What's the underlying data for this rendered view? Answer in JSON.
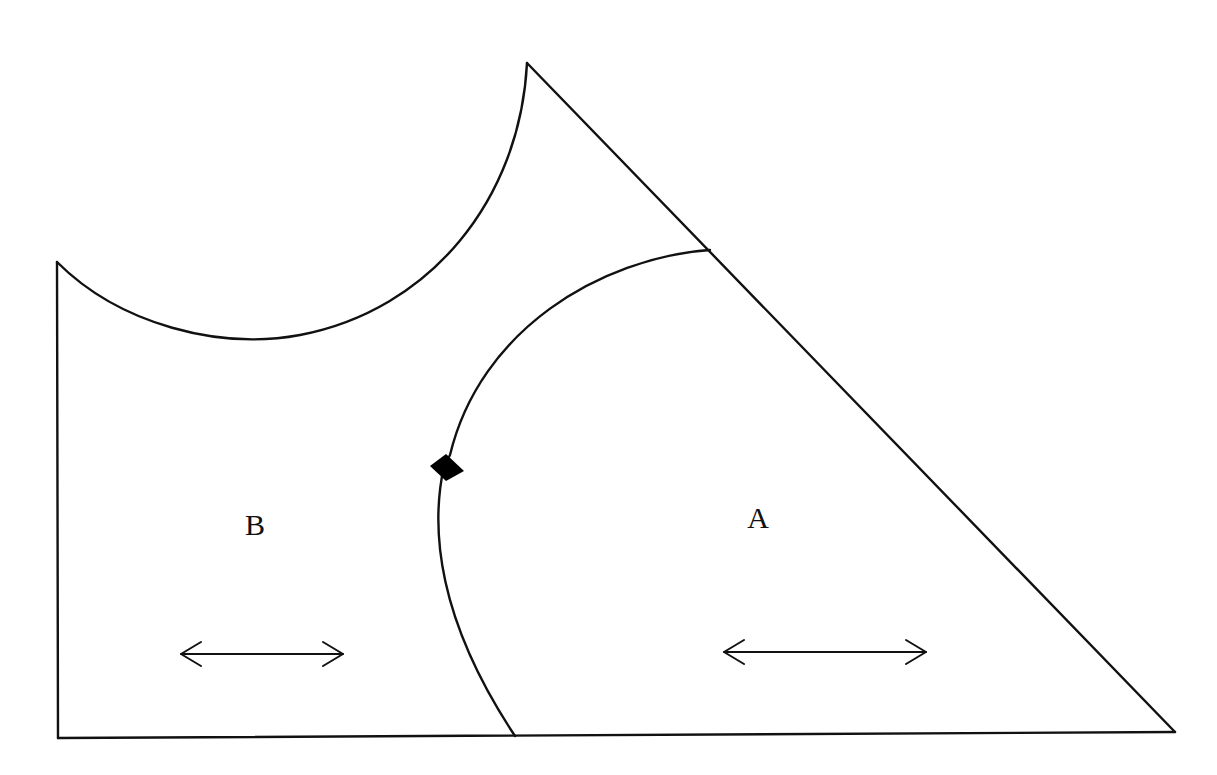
{
  "diagram": {
    "title": "",
    "regions": [
      {
        "id": "A",
        "label": "A",
        "label_pos": [
          758,
          518
        ],
        "arrow": {
          "from": [
            724,
            652
          ],
          "to": [
            926,
            652
          ]
        }
      },
      {
        "id": "B",
        "label": "B",
        "label_pos": [
          255,
          525
        ],
        "arrow": {
          "from": [
            181,
            654
          ],
          "to": [
            343,
            654
          ]
        }
      }
    ],
    "outer_shape": {
      "left_edge": {
        "from": [
          57,
          262
        ],
        "to": [
          58,
          738
        ]
      },
      "bottom_edge": {
        "from": [
          58,
          738
        ],
        "to": [
          1175,
          732
        ]
      },
      "diagonal_edge": {
        "from": [
          1175,
          732
        ],
        "to": [
          527,
          63
        ]
      },
      "top_concave_arc": {
        "from": [
          527,
          63
        ],
        "through": [
          250,
          340
        ],
        "to": [
          57,
          262
        ]
      }
    },
    "inner_boundary_arc": {
      "from": [
        710,
        250
      ],
      "through": [
        444,
        466
      ],
      "to": [
        515,
        736
      ]
    },
    "marker": {
      "shape": "diamond",
      "position": [
        444,
        466
      ],
      "fill": "#000000"
    },
    "colors": {
      "line": "#111111",
      "background": "#ffffff"
    }
  }
}
